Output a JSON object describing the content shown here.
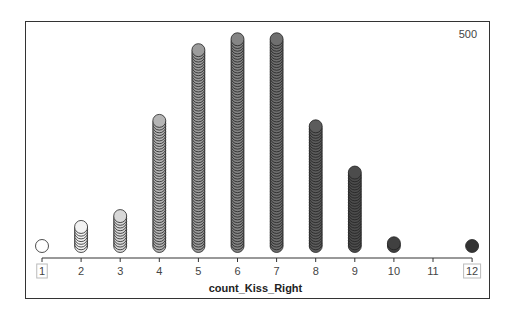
{
  "chart_data": {
    "type": "dot-stack",
    "title": "",
    "xlabel": "count_Kiss_Right",
    "ylabel": "",
    "corner_label": "500",
    "categories": [
      "1",
      "2",
      "3",
      "4",
      "5",
      "6",
      "7",
      "8",
      "9",
      "10",
      "11",
      "12"
    ],
    "values": [
      1,
      8,
      12,
      47,
      73,
      77,
      77,
      45,
      28,
      2,
      0,
      1
    ],
    "boxed_tick_labels": [
      "1",
      "12"
    ],
    "color_gradient": {
      "1": "#ffffff",
      "2": "#f2f2f2",
      "3": "#d8d8d8",
      "4": "#b5b5b5",
      "5": "#9c9c9c",
      "6": "#858585",
      "7": "#6f6f6f",
      "8": "#5c5c5c",
      "9": "#4c4c4c",
      "10": "#404040",
      "11": "#383838",
      "12": "#333333"
    },
    "grid": false,
    "legend": "none"
  }
}
